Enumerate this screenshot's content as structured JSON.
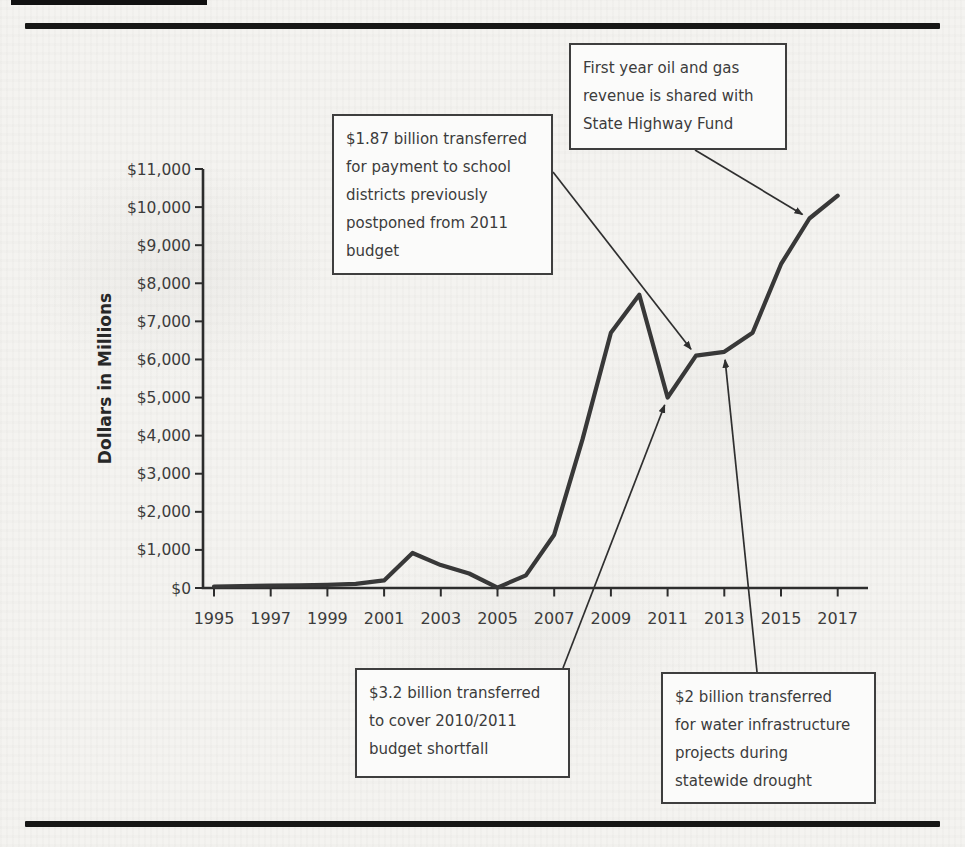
{
  "chart_data": {
    "type": "line",
    "title": "",
    "ylabel": "Dollars in Millions",
    "xlabel": "",
    "ylim": [
      0,
      11000
    ],
    "ytick_step": 1000,
    "grid": false,
    "legend": "none",
    "line_color": "#383838",
    "x": [
      1995,
      1996,
      1997,
      1998,
      1999,
      2000,
      2001,
      2002,
      2003,
      2004,
      2005,
      2006,
      2007,
      2008,
      2009,
      2010,
      2011,
      2012,
      2013,
      2014,
      2015,
      2016,
      2017
    ],
    "values": [
      40,
      50,
      60,
      70,
      85,
      110,
      200,
      920,
      600,
      380,
      10,
      330,
      1400,
      3900,
      6700,
      7700,
      5000,
      6100,
      6200,
      6700,
      8500,
      9700,
      10300
    ],
    "ytick_labels": [
      "$0",
      "$1,000",
      "$2,000",
      "$3,000",
      "$4,000",
      "$5,000",
      "$6,000",
      "$7,000",
      "$8,000",
      "$9,000",
      "$10,000",
      "$11,000"
    ],
    "xtick_labels": [
      "1995",
      "1997",
      "1999",
      "2001",
      "2003",
      "2005",
      "2007",
      "2009",
      "2011",
      "2013",
      "2015",
      "2017"
    ],
    "annotations": [
      {
        "id": "school-districts",
        "text": "$1.87 billion transferred\nfor payment to school\ndistricts previously\npostponed from 2011\nbudget",
        "target_year": 2012,
        "target_value": 6100
      },
      {
        "id": "highway-fund",
        "text": "First year oil and gas\nrevenue is shared with\nState Highway Fund",
        "target_year": 2016,
        "target_value": 9700
      },
      {
        "id": "budget-shortfall",
        "text": "$3.2 billion transferred\nto cover 2010/2011\nbudget shortfall",
        "target_year": 2011,
        "target_value": 5000
      },
      {
        "id": "water-projects",
        "text": "$2 billion transferred\nfor water infrastructure\nprojects during\nstatewide drought",
        "target_year": 2013,
        "target_value": 6200
      }
    ]
  },
  "colors": {
    "paper": "#f4f3f0",
    "rule": "#171716",
    "axis": "#2d2d2d",
    "line": "#383838",
    "arrow": "#2f2f2f",
    "text": "#3c3c3c",
    "box_bg": "#fbfbfa",
    "box_border": "#3e3e3e"
  }
}
